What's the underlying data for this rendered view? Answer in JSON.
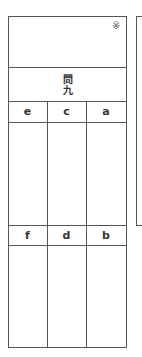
{
  "score_box": {
    "mark": "※"
  },
  "question": {
    "title_line1": "問",
    "title_line2": "九"
  },
  "table": {
    "row1_headers": [
      "e",
      "c",
      "a"
    ],
    "row2_headers": [
      "f",
      "d",
      "b"
    ]
  }
}
